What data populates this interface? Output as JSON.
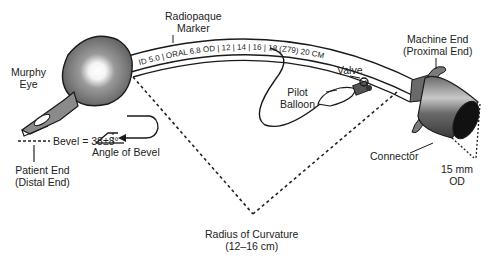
{
  "diagram": {
    "labels": {
      "radiopaque_marker": [
        "Radiopaque",
        "Marker"
      ],
      "machine_end": [
        "Machine End",
        "(Proximal End)"
      ],
      "murphy_eye": [
        "Murphy",
        "Eye"
      ],
      "valve": "Valve",
      "pilot_balloon": [
        "Pilot",
        "Balloon"
      ],
      "bevel": "Bevel = 38±8°",
      "patient_end": [
        "Patient End",
        "(Distal End)"
      ],
      "angle_of_bevel": "Angle of Bevel",
      "connector": "Connector",
      "od_15mm": [
        "15 mm",
        "OD"
      ],
      "radius_of_curvature": [
        "Radius of Curvature",
        "(12–16 cm)"
      ]
    },
    "tube_markings": [
      "ID",
      "5.0",
      "ORAL",
      "6.8 OD",
      "12",
      "14",
      "16",
      "18",
      "(Z79)",
      "20 CM"
    ],
    "colors": {
      "line": "#1a1a1a",
      "cuff": "#6e6e6e",
      "connector": "#5a5a5a",
      "background": "#ffffff"
    }
  }
}
